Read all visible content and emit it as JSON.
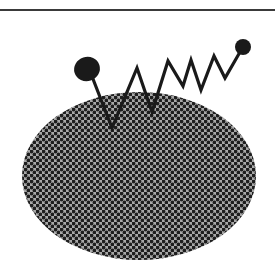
{
  "figure": {
    "colors": {
      "background": "#ffffff",
      "rule": "#3a3a3a",
      "oval_fill": "#a8a8a8",
      "oval_dots": "#1e1e1e",
      "stroke": "#1a1a1a",
      "knob": "#1a1a1a"
    },
    "rule": {
      "y": 10,
      "x1": 0,
      "x2": 275,
      "width": 2
    },
    "oval": {
      "cx": 139,
      "cy": 176,
      "rx": 117,
      "ry": 84,
      "dot_pitch": 6,
      "dot_radius": 1.9
    },
    "zigzag_points": [
      [
        93,
        79
      ],
      [
        112,
        128
      ],
      [
        137,
        68
      ],
      [
        152,
        112
      ],
      [
        168,
        61
      ],
      [
        183,
        86
      ],
      [
        191,
        60
      ],
      [
        201,
        90
      ],
      [
        214,
        56
      ],
      [
        225,
        78
      ],
      [
        240,
        52
      ]
    ],
    "left_knob": {
      "cx": 87,
      "cy": 69,
      "rx": 13,
      "ry": 12,
      "rotate": -18
    },
    "right_knob": {
      "cx": 243,
      "cy": 47,
      "r": 8
    }
  }
}
